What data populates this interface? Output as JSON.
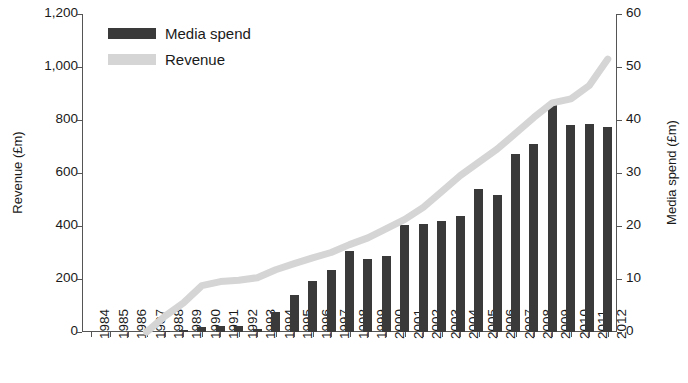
{
  "chart_data": {
    "type": "bar",
    "title": "",
    "subtitle": "",
    "xlabel": "",
    "ylabel": "Revenue (£m)",
    "y2label": "Media spend (£m)",
    "ylim": [
      0,
      1200
    ],
    "y2lim": [
      0,
      60
    ],
    "yticks": [
      "0",
      "200",
      "400",
      "600",
      "800",
      "1,000",
      "1,200"
    ],
    "ytick_values": [
      0,
      200,
      400,
      600,
      800,
      1000,
      1200
    ],
    "y2ticks": [
      "0",
      "10",
      "20",
      "30",
      "40",
      "50",
      "60"
    ],
    "y2tick_values": [
      0,
      10,
      20,
      30,
      40,
      50,
      60
    ],
    "grid": false,
    "legend_position": "top-left",
    "categories": [
      "1984",
      "1985",
      "1986",
      "1987",
      "1988",
      "1989",
      "1990",
      "1991",
      "1992",
      "1993",
      "1994",
      "1995",
      "1996",
      "1997",
      "1998",
      "1999",
      "2000",
      "2001",
      "2002",
      "2003",
      "2004",
      "2005",
      "2006",
      "2007",
      "2008",
      "2009",
      "2010",
      "2011",
      "2012"
    ],
    "series": [
      {
        "name": "Media spend",
        "type": "bar",
        "axis": "right",
        "unit": "£m",
        "color": "#3a3a3a",
        "values": [
          0,
          0,
          0,
          0,
          0.2,
          0.3,
          1.0,
          1.1,
          1.1,
          0.5,
          3.8,
          7.0,
          9.6,
          11.7,
          15.2,
          13.7,
          14.3,
          20.1,
          20.3,
          21.0,
          21.8,
          27.0,
          25.8,
          33.5,
          35.5,
          43.0,
          39.0,
          39.2,
          38.6
        ]
      },
      {
        "name": "Revenue",
        "type": "line",
        "axis": "left",
        "unit": "£m",
        "color": "#d5d5d5",
        "values": [
          null,
          null,
          null,
          0,
          60,
          110,
          175,
          190,
          195,
          205,
          235,
          258,
          280,
          300,
          330,
          355,
          390,
          425,
          470,
          530,
          590,
          640,
          690,
          750,
          810,
          865,
          880,
          930,
          1030
        ]
      }
    ]
  }
}
